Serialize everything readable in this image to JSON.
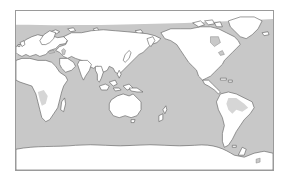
{
  "map": {
    "projection": "equirectangular",
    "center": "pacific",
    "colors": {
      "ocean": "#c8c8c8",
      "land": "#ffffff",
      "coastline": "#5a5a5a",
      "frame": "#9a9a9a",
      "background": "#ffffff",
      "land_shading": "#d6d6d6"
    },
    "regions": [
      {
        "id": "arctic-ice-cap",
        "label": "Arctic"
      },
      {
        "id": "europe",
        "label": "Europe"
      },
      {
        "id": "africa",
        "label": "Africa"
      },
      {
        "id": "asia",
        "label": "Asia"
      },
      {
        "id": "australia",
        "label": "Australia"
      },
      {
        "id": "north-america",
        "label": "North America"
      },
      {
        "id": "greenland",
        "label": "Greenland"
      },
      {
        "id": "south-america",
        "label": "South America"
      },
      {
        "id": "antarctica",
        "label": "Antarctica"
      },
      {
        "id": "new-zealand",
        "label": "New Zealand"
      },
      {
        "id": "madagascar",
        "label": "Madagascar"
      },
      {
        "id": "japan",
        "label": "Japan"
      },
      {
        "id": "indonesia",
        "label": "Indonesia"
      }
    ]
  }
}
